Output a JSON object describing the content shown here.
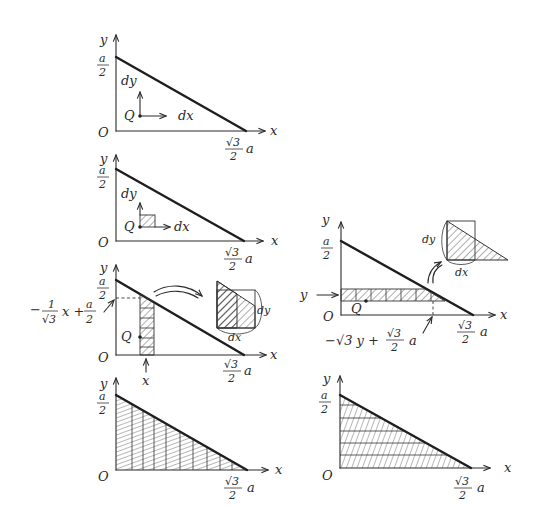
{
  "diagram": {
    "common_labels": {
      "origin": "O",
      "x_axis": "x",
      "y_axis": "y",
      "y_intercept_num": "a",
      "y_intercept_den": "2",
      "x_intercept_num": "√3",
      "x_intercept_den": "2",
      "x_intercept_a": "a"
    },
    "panels": [
      {
        "id": "point-element",
        "point_label": "Q",
        "dx_label": "dx",
        "dy_label": "dy"
      },
      {
        "id": "area-element",
        "point_label": "Q",
        "dx_label": "dx",
        "dy_label": "dy"
      },
      {
        "id": "vertical-strip",
        "point_label": "Q",
        "strip_position_label": "x",
        "upper_bound_expr": {
          "minus": "−",
          "num1": "1",
          "den1": "√3",
          "x": "x +",
          "num2": "a",
          "den2": "2"
        },
        "inset_dx": "dx",
        "inset_dy": "dy"
      },
      {
        "id": "horizontal-strip",
        "point_label": "Q",
        "strip_position_label": "y",
        "right_bound_expr": {
          "lead": "−√3 y +",
          "num": "√3",
          "den": "2",
          "a": "a"
        },
        "inset_dx": "dx",
        "inset_dy": "dy"
      },
      {
        "id": "vertical-sum",
        "caption": ""
      },
      {
        "id": "horizontal-sum",
        "caption": ""
      }
    ]
  }
}
